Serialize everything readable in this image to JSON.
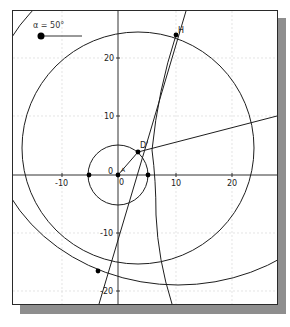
{
  "slider": {
    "label": "α = 50°",
    "name": "α",
    "value_deg": 50
  },
  "axes": {
    "x_ticks": [
      "-10",
      "10",
      "20"
    ],
    "y_ticks": [
      "20",
      "10",
      "-10",
      "-20"
    ],
    "origin_label": "0",
    "origin_label_y": "0"
  },
  "points": {
    "H": "H",
    "D_prime": "D'",
    "A": "A"
  },
  "colors": {
    "stroke": "#1e1e1e",
    "grid": "#d8d8d8",
    "shadow": "#8e8e8e",
    "frame": "#2a2a2a"
  }
}
